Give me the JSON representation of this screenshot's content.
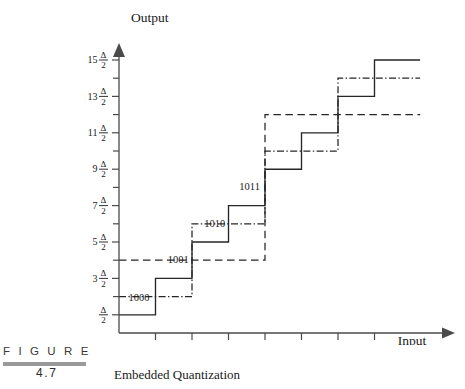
{
  "figure": {
    "word": "F I G U R E",
    "number": "4.7",
    "caption": "Embedded Quantization"
  },
  "axes": {
    "y_title": "Output",
    "x_title": "Input",
    "y_ticks": [
      {
        "coef": "",
        "delta": "Δ",
        "den": "2",
        "value": 0.5
      },
      {
        "coef": "3",
        "delta": "Δ",
        "den": "2",
        "value": 1.5
      },
      {
        "coef": "5",
        "delta": "Δ",
        "den": "2",
        "value": 2.5
      },
      {
        "coef": "7",
        "delta": "Δ",
        "den": "2",
        "value": 3.5
      },
      {
        "coef": "9",
        "delta": "Δ",
        "den": "2",
        "value": 4.5
      },
      {
        "coef": "11",
        "delta": "Δ",
        "den": "2",
        "value": 5.5
      },
      {
        "coef": "13",
        "delta": "Δ",
        "den": "2",
        "value": 6.5
      },
      {
        "coef": "15",
        "delta": "Δ",
        "den": "2",
        "value": 7.5
      }
    ],
    "y_minor_values": [
      1,
      2,
      3,
      4,
      5,
      6,
      7
    ],
    "x_ticks": [
      {
        "label": "Δ",
        "value": 1
      },
      {
        "label": "2Δ",
        "value": 2
      },
      {
        "label": "3Δ",
        "value": 3
      },
      {
        "label": "4Δ",
        "value": 4
      },
      {
        "label": "5Δ",
        "value": 5
      },
      {
        "label": "6Δ",
        "value": 6
      },
      {
        "label": "7Δ",
        "value": 7
      }
    ]
  },
  "codewords": [
    {
      "text": "1000",
      "x": 0.55,
      "y": 0.88
    },
    {
      "text": "1001",
      "x": 1.62,
      "y": 1.92
    },
    {
      "text": "1010",
      "x": 2.62,
      "y": 2.92
    },
    {
      "text": "1011",
      "x": 3.58,
      "y": 3.92
    }
  ],
  "chart_data": {
    "type": "line",
    "title": "Embedded Quantization",
    "xlabel": "Input",
    "ylabel": "Output",
    "xlim": [
      0,
      8.25
    ],
    "ylim": [
      0,
      8.1
    ],
    "grid": false,
    "legend": "none",
    "x_unit": "Δ",
    "y_unit": "Δ/2",
    "series": [
      {
        "name": "fine-quantizer",
        "style": "solid",
        "step_size": 1,
        "points": [
          [
            0,
            0.5
          ],
          [
            1,
            0.5
          ],
          [
            1,
            1.5
          ],
          [
            2,
            1.5
          ],
          [
            2,
            2.5
          ],
          [
            3,
            2.5
          ],
          [
            3,
            3.5
          ],
          [
            4,
            3.5
          ],
          [
            4,
            4.5
          ],
          [
            5,
            4.5
          ],
          [
            5,
            5.5
          ],
          [
            6,
            5.5
          ],
          [
            6,
            6.5
          ],
          [
            7,
            6.5
          ],
          [
            7,
            7.5
          ],
          [
            8.25,
            7.5
          ]
        ]
      },
      {
        "name": "medium-quantizer",
        "style": "dash-dot",
        "step_size": 2,
        "points": [
          [
            0,
            1.0
          ],
          [
            2,
            1.0
          ],
          [
            2,
            3.0
          ],
          [
            4,
            3.0
          ],
          [
            4,
            5.0
          ],
          [
            6,
            5.0
          ],
          [
            6,
            7.0
          ],
          [
            8.25,
            7.0
          ]
        ]
      },
      {
        "name": "coarse-quantizer",
        "style": "dashed",
        "step_size": 4,
        "points": [
          [
            0,
            2.0
          ],
          [
            4,
            2.0
          ],
          [
            4,
            6.0
          ],
          [
            8.25,
            6.0
          ]
        ]
      }
    ]
  }
}
